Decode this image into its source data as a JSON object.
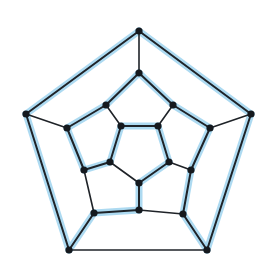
{
  "diagram": {
    "type": "graph",
    "colors": {
      "edge": "#1f2328",
      "highlight": "#9fd3ee",
      "node": "#15191e",
      "background": "#ffffff"
    },
    "nodes": [
      {
        "id": "O0",
        "x": 139,
        "y": 31
      },
      {
        "id": "O1",
        "x": 251,
        "y": 114
      },
      {
        "id": "O2",
        "x": 207,
        "y": 250
      },
      {
        "id": "O3",
        "x": 69,
        "y": 250
      },
      {
        "id": "O4",
        "x": 26,
        "y": 114
      },
      {
        "id": "M0",
        "x": 139,
        "y": 73
      },
      {
        "id": "M1",
        "x": 173,
        "y": 105
      },
      {
        "id": "M2",
        "x": 210,
        "y": 128
      },
      {
        "id": "M3",
        "x": 191,
        "y": 170
      },
      {
        "id": "M4",
        "x": 183,
        "y": 214
      },
      {
        "id": "M5",
        "x": 139,
        "y": 210
      },
      {
        "id": "M6",
        "x": 94,
        "y": 213
      },
      {
        "id": "M7",
        "x": 84,
        "y": 170
      },
      {
        "id": "M8",
        "x": 67,
        "y": 128
      },
      {
        "id": "M9",
        "x": 106,
        "y": 105
      },
      {
        "id": "I0",
        "x": 121,
        "y": 126
      },
      {
        "id": "I1",
        "x": 158,
        "y": 126
      },
      {
        "id": "I2",
        "x": 169,
        "y": 162
      },
      {
        "id": "I3",
        "x": 139,
        "y": 183
      },
      {
        "id": "I4",
        "x": 110,
        "y": 162
      }
    ],
    "edges": [
      {
        "a": "O0",
        "b": "O1",
        "cycle": true
      },
      {
        "a": "O1",
        "b": "O2",
        "cycle": true
      },
      {
        "a": "O2",
        "b": "O3",
        "cycle": false
      },
      {
        "a": "O3",
        "b": "O4",
        "cycle": true
      },
      {
        "a": "O4",
        "b": "O0",
        "cycle": true
      },
      {
        "a": "O0",
        "b": "M0",
        "cycle": false
      },
      {
        "a": "O1",
        "b": "M2",
        "cycle": false
      },
      {
        "a": "O2",
        "b": "M4",
        "cycle": true
      },
      {
        "a": "O3",
        "b": "M6",
        "cycle": true
      },
      {
        "a": "O4",
        "b": "M8",
        "cycle": false
      },
      {
        "a": "M0",
        "b": "M1",
        "cycle": true
      },
      {
        "a": "M1",
        "b": "M2",
        "cycle": true
      },
      {
        "a": "M2",
        "b": "M3",
        "cycle": true
      },
      {
        "a": "M3",
        "b": "M4",
        "cycle": true
      },
      {
        "a": "M4",
        "b": "M5",
        "cycle": false
      },
      {
        "a": "M5",
        "b": "M6",
        "cycle": true
      },
      {
        "a": "M6",
        "b": "M7",
        "cycle": false
      },
      {
        "a": "M7",
        "b": "M8",
        "cycle": true
      },
      {
        "a": "M8",
        "b": "M9",
        "cycle": true
      },
      {
        "a": "M9",
        "b": "M0",
        "cycle": true
      },
      {
        "a": "M1",
        "b": "I1",
        "cycle": false
      },
      {
        "a": "M3",
        "b": "I2",
        "cycle": false
      },
      {
        "a": "M5",
        "b": "I3",
        "cycle": true
      },
      {
        "a": "M7",
        "b": "I4",
        "cycle": true
      },
      {
        "a": "M9",
        "b": "I0",
        "cycle": false
      },
      {
        "a": "I0",
        "b": "I1",
        "cycle": true
      },
      {
        "a": "I1",
        "b": "I2",
        "cycle": true
      },
      {
        "a": "I2",
        "b": "I3",
        "cycle": true
      },
      {
        "a": "I3",
        "b": "I4",
        "cycle": false
      },
      {
        "a": "I4",
        "b": "I0",
        "cycle": true
      }
    ],
    "hamiltonian_cycle": [
      "O0",
      "O1",
      "O2",
      "M4",
      "M3",
      "M2",
      "M1",
      "M0",
      "M9",
      "M8",
      "M7",
      "I4",
      "I0",
      "I1",
      "I2",
      "I3",
      "M5",
      "M6",
      "O3",
      "O4",
      "O0"
    ]
  }
}
